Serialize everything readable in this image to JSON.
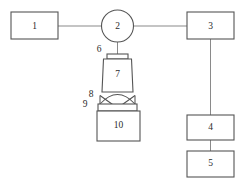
{
  "diagram": {
    "type": "schematic-flow-diagram",
    "canvas": {
      "width": 245,
      "height": 187
    },
    "colors": {
      "background": "#ffffff",
      "outline": "#555555",
      "connector": "#8a8a8a",
      "label_text": "#2b2b2b"
    },
    "nodes": {
      "n1": {
        "label": "1",
        "shape": "rectangle"
      },
      "n2": {
        "label": "2",
        "shape": "circle"
      },
      "n3": {
        "label": "3",
        "shape": "rectangle"
      },
      "n4": {
        "label": "4",
        "shape": "rectangle"
      },
      "n5": {
        "label": "5",
        "shape": "rectangle"
      },
      "n6": {
        "label": "6",
        "shape": "flange-bar"
      },
      "n7": {
        "label": "7",
        "shape": "vessel-body"
      },
      "n8": {
        "label": "8",
        "shape": "dome-arc"
      },
      "n9": {
        "label": "9",
        "shape": "narrow-band"
      },
      "n10": {
        "label": "10",
        "shape": "rectangle"
      }
    },
    "connections": [
      {
        "from": "n1",
        "to": "n2",
        "orientation": "horizontal"
      },
      {
        "from": "n2",
        "to": "n3",
        "orientation": "horizontal"
      },
      {
        "from": "n2",
        "to": "n6",
        "orientation": "vertical"
      },
      {
        "from": "n3",
        "to": "n4",
        "orientation": "vertical"
      },
      {
        "from": "n4",
        "to": "n5",
        "orientation": "vertical"
      }
    ]
  }
}
